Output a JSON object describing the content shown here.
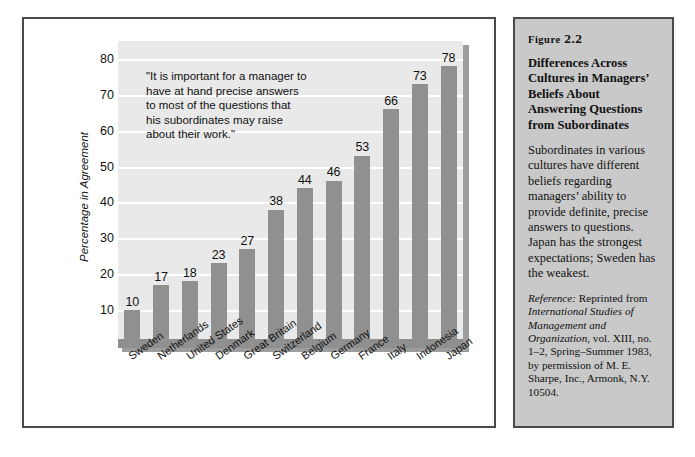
{
  "chart_data": {
    "type": "bar",
    "title": "",
    "xlabel": "",
    "ylabel": "Percentage in Agreement",
    "ylim": [
      0,
      85
    ],
    "yticks": [
      10,
      20,
      30,
      40,
      50,
      60,
      70,
      80
    ],
    "grid": true,
    "legend": "none",
    "bar_color": "#909090",
    "plot_background": "#e9e9e9",
    "categories": [
      "Sweden",
      "Netherlands",
      "United States",
      "Denmark",
      "Great Britain",
      "Switzerland",
      "Belgium",
      "Germany",
      "France",
      "Italy",
      "Indonesia",
      "Japan"
    ],
    "values": [
      10,
      17,
      18,
      23,
      27,
      38,
      44,
      46,
      53,
      66,
      73,
      78
    ],
    "annotation": "\"It is important for a manager to have at hand precise answers to most of the questions that his subordinates may raise about their work.\"",
    "annotation_lines": [
      "\"It is important for a manager to",
      "have at hand precise answers",
      "to most of the questions that",
      "his subordinates may raise",
      "about their work.\""
    ]
  },
  "sidebar": {
    "kicker_word": "Figure",
    "kicker_number": "2.2",
    "title": "Differences Across Cultures in Managers’ Beliefs About Answering Questions from Subordinates",
    "body": "Subordinates in various cultures have different beliefs regarding managers’ ability to provide definite, precise answers to questions. Japan has the strongest expectations; Sweden has the weakest.",
    "reference_label": "Reference:",
    "reference_text_1": " Reprinted from ",
    "reference_italic_1": "International Studies of Management and Organization,",
    "reference_text_2": " vol. XIII, no. 1–2, Spring–Summer 1983, by permission of M. E. Sharpe, Inc., Armonk, N.Y. 10504.",
    "panel_color": "#c9c9c9"
  }
}
